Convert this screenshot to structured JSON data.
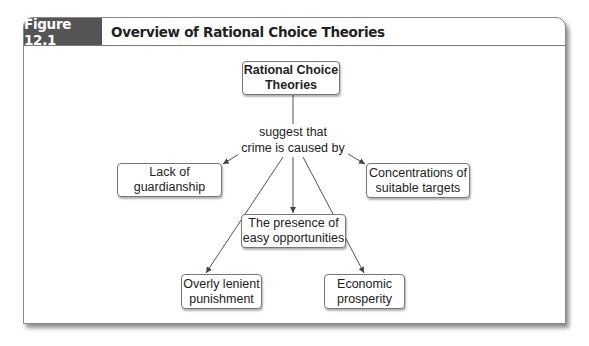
{
  "figure": {
    "number_label": "Figure 12.1",
    "title": "Overview of Rational Choice Theories"
  },
  "diagram": {
    "root": {
      "line1": "Rational Choice",
      "line2": "Theories"
    },
    "connector": {
      "line1": "suggest that",
      "line2": "crime is caused by"
    },
    "nodes": {
      "guardianship": {
        "line1": "Lack of",
        "line2": "guardianship"
      },
      "targets": {
        "line1": "Concentrations of",
        "line2": "suitable targets"
      },
      "opportunities": {
        "line1": "The presence of",
        "line2": "easy opportunities"
      },
      "punishment": {
        "line1": "Overly lenient",
        "line2": "punishment"
      },
      "prosperity": {
        "line1": "Economic",
        "line2": "prosperity"
      }
    },
    "colors": {
      "tab_bg": "#555555",
      "line": "#555555",
      "border": "#777777"
    }
  }
}
